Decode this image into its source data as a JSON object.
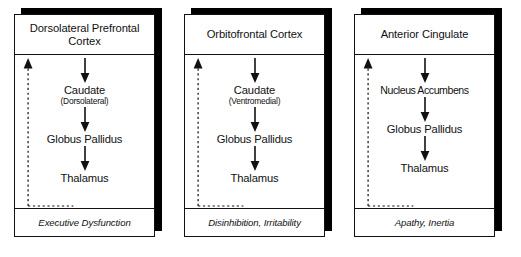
{
  "figure": {
    "type": "diagram",
    "subtype": "frontal-subcortical-circuits",
    "panel_count": 3
  },
  "panels": [
    {
      "header": "Dorsolateral Prefrontal Cortex",
      "nodes": [
        {
          "main": "Caudate",
          "sub": "(Dorsolateral)"
        },
        {
          "main": "Globus Pallidus",
          "sub": ""
        },
        {
          "main": "Thalamus",
          "sub": ""
        }
      ],
      "footer": "Executive Dysfunction",
      "feedback_label": "thalamus-to-cortex-feedback"
    },
    {
      "header": "Orbitofrontal Cortex",
      "nodes": [
        {
          "main": "Caudate",
          "sub": "(Ventromedial)"
        },
        {
          "main": "Globus Pallidus",
          "sub": ""
        },
        {
          "main": "Thalamus",
          "sub": ""
        }
      ],
      "footer": "Disinhibition, Irritability",
      "feedback_label": "thalamus-to-cortex-feedback"
    },
    {
      "header": "Anterior Cingulate",
      "nodes": [
        {
          "main": "Nucleus Accumbens",
          "sub": ""
        },
        {
          "main": "Globus Pallidus",
          "sub": ""
        },
        {
          "main": "Thalamus",
          "sub": ""
        }
      ],
      "footer": "Apathy, Inertia",
      "feedback_label": "thalamus-to-cortex-feedback"
    }
  ],
  "style": {
    "line_color": "#111111",
    "shadow_color": "#000000",
    "background": "#ffffff",
    "arrow_style_forward": "solid",
    "arrow_style_feedback": "dashed"
  }
}
